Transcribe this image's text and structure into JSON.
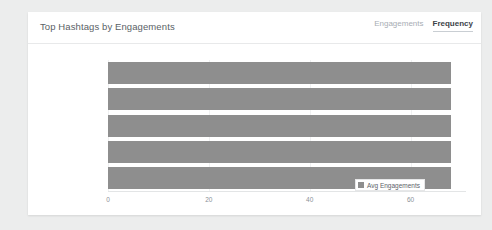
{
  "card": {
    "title": "Top Hashtags by Engagements",
    "tabs": [
      {
        "label": "Engagements",
        "active": false
      },
      {
        "label": "Frequency",
        "active": true
      }
    ]
  },
  "legend": {
    "marker_icon": "square-marker-icon",
    "label": "Avg Engagements",
    "color": "#8e8e8e"
  },
  "colors": {
    "page_background": "#eceded",
    "card_background": "#ffffff",
    "bar": "#8e8e8e",
    "grid": "#f0f1f2",
    "axis": "#e3e5e6",
    "tab_active": "#3d4349",
    "tab_inactive": "#a7adb4",
    "title": "#5a5f66",
    "tick_label": "#8b9097"
  },
  "chart_data": {
    "type": "bar",
    "orientation": "horizontal",
    "title": "Top Hashtags by Engagements",
    "xlabel": "",
    "ylabel": "",
    "categories": [
      "#eatgreen",
      "#eatclean",
      "#eathealthy",
      "#drinkkombucha",
      "#lowsugardiet"
    ],
    "series": [
      {
        "name": "Avg Engagements",
        "values": [
          68,
          68,
          68,
          68,
          68
        ],
        "color": "#8e8e8e"
      }
    ],
    "xticks": [
      0,
      20,
      40,
      60
    ],
    "xlim": [
      0,
      71
    ],
    "grid": true,
    "legend_position": "bottom-right"
  }
}
